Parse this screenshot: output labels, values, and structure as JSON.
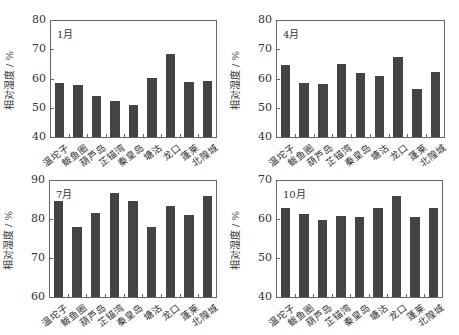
{
  "chart_data": [
    {
      "type": "bar",
      "title": "1月",
      "xlabel": "",
      "ylabel": "相对湿度 / %",
      "ylim": [
        40,
        80
      ],
      "yticks": [
        40,
        50,
        60,
        70,
        80
      ],
      "categories": [
        "温坨子",
        "鲅鱼圈",
        "葫芦岛",
        "芷锚湾",
        "秦皇岛",
        "塘沽",
        "龙口",
        "蓬莱",
        "北隍城"
      ],
      "values": [
        58.5,
        57.8,
        54.1,
        52.4,
        51.0,
        60.2,
        68.4,
        58.8,
        59.2
      ],
      "grid": false
    },
    {
      "type": "bar",
      "title": "4月",
      "xlabel": "",
      "ylabel": "相对湿度 / %",
      "ylim": [
        40,
        80
      ],
      "yticks": [
        40,
        50,
        60,
        70,
        80
      ],
      "categories": [
        "温坨子",
        "鲅鱼圈",
        "葫芦岛",
        "芷锚湾",
        "秦皇岛",
        "塘沽",
        "龙口",
        "蓬莱",
        "北隍城"
      ],
      "values": [
        64.6,
        58.5,
        58.2,
        65.1,
        61.8,
        60.7,
        67.3,
        56.3,
        62.2
      ],
      "grid": false
    },
    {
      "type": "bar",
      "title": "7月",
      "xlabel": "",
      "ylabel": "相对湿度 / %",
      "ylim": [
        60,
        90
      ],
      "yticks": [
        60,
        70,
        80,
        90
      ],
      "categories": [
        "温坨子",
        "鲅鱼圈",
        "葫芦岛",
        "芷锚湾",
        "秦皇岛",
        "塘沽",
        "龙口",
        "蓬莱",
        "北隍城"
      ],
      "values": [
        84.7,
        78.0,
        81.6,
        86.6,
        84.6,
        78.0,
        83.4,
        80.9,
        85.9
      ],
      "grid": false
    },
    {
      "type": "bar",
      "title": "10月",
      "xlabel": "",
      "ylabel": "相对湿度 / %",
      "ylim": [
        40,
        70
      ],
      "yticks": [
        40,
        50,
        60,
        70
      ],
      "categories": [
        "温坨子",
        "鲅鱼圈",
        "葫芦岛",
        "芷锚湾",
        "秦皇岛",
        "塘沽",
        "龙口",
        "蓬莱",
        "北隍城"
      ],
      "values": [
        62.8,
        61.3,
        59.8,
        60.8,
        60.5,
        62.8,
        65.9,
        60.6,
        62.8
      ],
      "grid": false
    }
  ],
  "layout": {
    "panels": [
      {
        "left": 50,
        "top": 20,
        "width": 167,
        "height": 117,
        "title_x": 7,
        "title_y": 6
      },
      {
        "left": 276,
        "top": 20,
        "width": 169,
        "height": 117,
        "title_x": 7,
        "title_y": 6
      },
      {
        "left": 49,
        "top": 180,
        "width": 168,
        "height": 117,
        "title_x": 7,
        "title_y": 6
      },
      {
        "left": 276,
        "top": 180,
        "width": 167,
        "height": 117,
        "title_x": 7,
        "title_y": 6
      }
    ],
    "bar_color": "#444444",
    "frame_color": "#666666"
  }
}
